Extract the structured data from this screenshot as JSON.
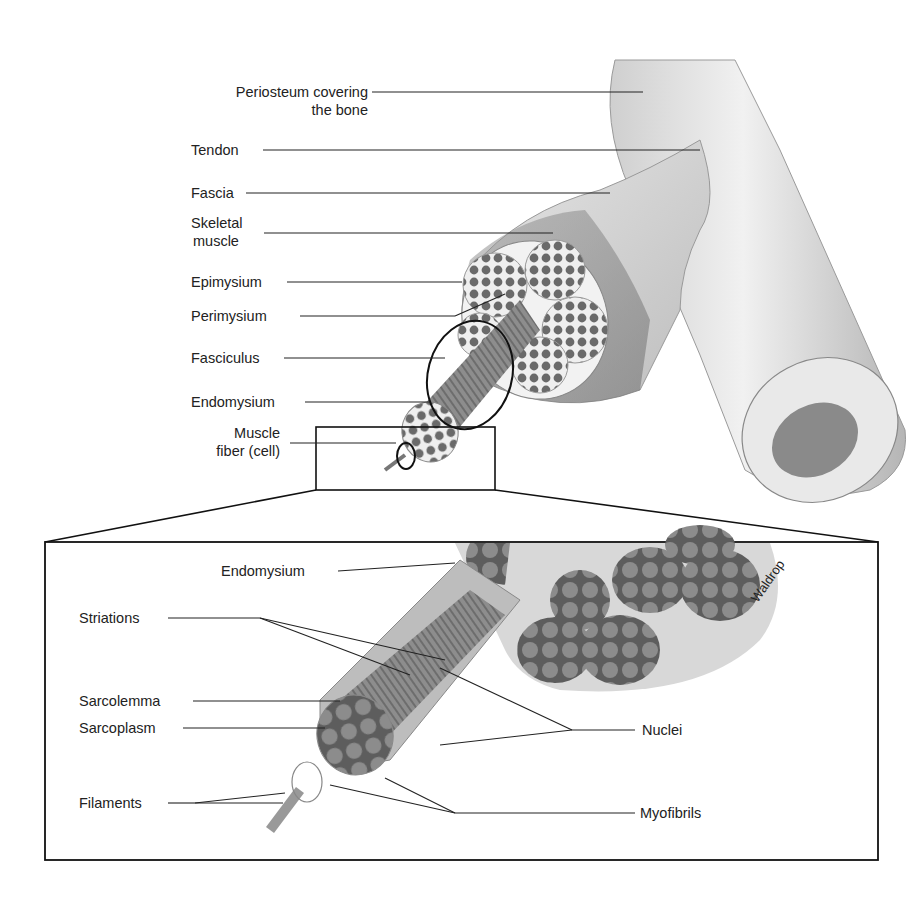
{
  "diagram": {
    "upper_labels": [
      {
        "id": "periosteum",
        "line1": "Periosteum covering",
        "line2": "the bone"
      },
      {
        "id": "tendon",
        "line1": "Tendon"
      },
      {
        "id": "fascia",
        "line1": "Fascia"
      },
      {
        "id": "skeletal-muscle",
        "line1": "Skeletal",
        "line2": "muscle"
      },
      {
        "id": "epimysium",
        "line1": "Epimysium"
      },
      {
        "id": "perimysium",
        "line1": "Perimysium"
      },
      {
        "id": "fasciculus",
        "line1": "Fasciculus"
      },
      {
        "id": "endomysium",
        "line1": "Endomysium"
      },
      {
        "id": "muscle-fiber",
        "line1": "Muscle",
        "line2": "fiber (cell)"
      }
    ],
    "inset_labels": [
      {
        "id": "endomysium-inset",
        "text": "Endomysium"
      },
      {
        "id": "striations",
        "text": "Striations"
      },
      {
        "id": "sarcolemma",
        "text": "Sarcolemma"
      },
      {
        "id": "sarcoplasm",
        "text": "Sarcoplasm"
      },
      {
        "id": "filaments",
        "text": "Filaments"
      },
      {
        "id": "nuclei",
        "text": "Nuclei"
      },
      {
        "id": "myofibrils",
        "text": "Myofibrils"
      }
    ],
    "signature": "Waldrop",
    "colors": {
      "line": "#1a1a1a",
      "tissue_dark": "#6e6e6e",
      "tissue_mid": "#a9a9a9",
      "tissue_light": "#dcdcdc",
      "bg": "#ffffff"
    }
  }
}
